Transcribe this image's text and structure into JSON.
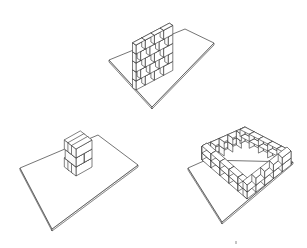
{
  "illustration": {
    "description": "Three hand-drawn sketches of brick structures on flat base plates",
    "colors": {
      "line": "#2a2a2a",
      "background": "#ffffff",
      "fill": "#ffffff"
    },
    "figures": [
      {
        "id": "wall",
        "label": "Straight brick wall on plate",
        "courses": 5,
        "bricks_per_course": 4
      },
      {
        "id": "pier",
        "label": "Brick pier / column on plate",
        "courses": 3
      },
      {
        "id": "enclosure",
        "label": "Square brick enclosure on plate",
        "courses": 2,
        "bricks_per_side": 5
      }
    ]
  }
}
